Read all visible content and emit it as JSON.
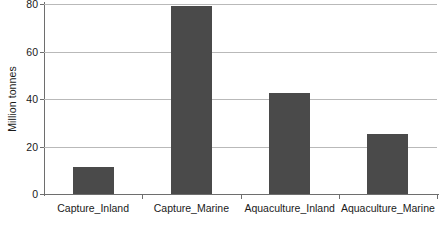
{
  "chart_data": {
    "type": "bar",
    "title": "",
    "subtitle": "",
    "xlabel": "",
    "ylabel": "Million tonnes",
    "categories": [
      "Capture_Inland",
      "Capture_Marine",
      "Aquaculture_Inland",
      "Aquaculture_Marine"
    ],
    "values": [
      11.3,
      79.0,
      42.5,
      25.3
    ],
    "ylim": [
      0,
      80
    ],
    "yticks": [
      0,
      20,
      40,
      60,
      80
    ],
    "ytick_labels": [
      "0",
      "20",
      "40",
      "60",
      "80"
    ],
    "grid": true,
    "legend": false,
    "legend_position": "none",
    "series": [
      {
        "name": "Production",
        "values": [
          11.3,
          79.0,
          42.5,
          25.3
        ]
      }
    ],
    "colors": {
      "bar": "#4a4a4a",
      "gridline": "#b9b9b9",
      "axis": "#6e6e6e",
      "text": "#1a1a1a",
      "background": "#ffffff"
    }
  }
}
